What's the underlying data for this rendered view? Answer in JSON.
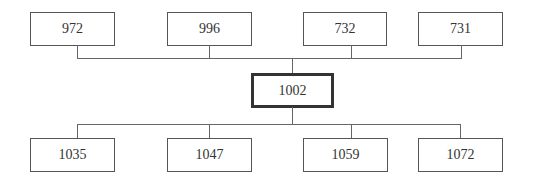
{
  "diagram": {
    "type": "hierarchy",
    "center": {
      "label": "1002"
    },
    "top_nodes": [
      {
        "label": "972"
      },
      {
        "label": "996"
      },
      {
        "label": "732"
      },
      {
        "label": "731"
      }
    ],
    "bottom_nodes": [
      {
        "label": "1035"
      },
      {
        "label": "1047"
      },
      {
        "label": "1059"
      },
      {
        "label": "1072"
      }
    ]
  }
}
